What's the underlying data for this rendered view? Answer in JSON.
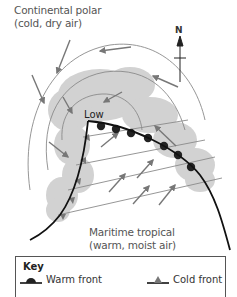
{
  "diagram": {
    "type": "weather-front-low-pressure",
    "labels": {
      "continental_polar_line1": "Continental polar",
      "continental_polar_line2": "(cold, dry air)",
      "maritime_tropical_line1": "Maritime tropical",
      "maritime_tropical_line2": "(warm, moist air)",
      "low": "Low",
      "north": "N"
    },
    "key": {
      "title": "Key",
      "items": [
        {
          "label": "Warm front",
          "symbol": "semicircle"
        },
        {
          "label": "Cold front",
          "symbol": "triangle"
        }
      ]
    },
    "colors": {
      "isobar": "#8a8a8a",
      "arrow": "#777777",
      "front_line": "#111111",
      "warm_front_symbol": "#222222",
      "cold_front_symbol": "#777777",
      "cloud": "#cfcfcf",
      "text": "#555555"
    }
  }
}
